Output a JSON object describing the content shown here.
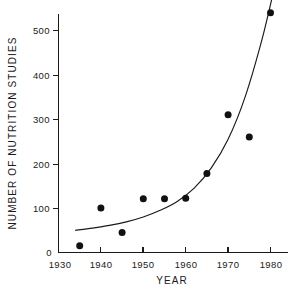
{
  "chart_data": {
    "type": "scatter",
    "title": "",
    "xlabel": "YEAR",
    "ylabel": "NUMBER OF NUTRITION STUDIES",
    "xlim": [
      1930,
      1984
    ],
    "ylim": [
      0,
      560
    ],
    "grid": false,
    "legend": "none",
    "x": [
      1935,
      1940,
      1945,
      1950,
      1955,
      1960,
      1965,
      1970,
      1975,
      1980
    ],
    "values": [
      15,
      100,
      45,
      121,
      121,
      122,
      178,
      310,
      260,
      540
    ],
    "points": [
      {
        "x": 1935,
        "y": 15
      },
      {
        "x": 1940,
        "y": 100
      },
      {
        "x": 1945,
        "y": 45
      },
      {
        "x": 1950,
        "y": 121
      },
      {
        "x": 1955,
        "y": 121
      },
      {
        "x": 1960,
        "y": 122
      },
      {
        "x": 1965,
        "y": 178
      },
      {
        "x": 1970,
        "y": 310
      },
      {
        "x": 1975,
        "y": 260
      },
      {
        "x": 1980,
        "y": 540
      }
    ],
    "fit_curve": {
      "name": "exponential trend",
      "x": [
        1934,
        1938,
        1942,
        1946,
        1950,
        1954,
        1958,
        1962,
        1966,
        1970,
        1974,
        1978,
        1981
      ],
      "y": [
        50,
        55,
        61,
        69,
        80,
        95,
        115,
        145,
        190,
        255,
        350,
        480,
        600
      ]
    },
    "xticks": [
      1930,
      1940,
      1950,
      1960,
      1970,
      1980
    ],
    "xtick_labels": [
      "1930",
      "1940",
      "1950",
      "1960",
      "1970",
      "1980"
    ],
    "yticks": [
      0,
      100,
      200,
      300,
      400,
      500
    ],
    "ytick_labels": [
      "0",
      "100",
      "200",
      "300",
      "400",
      "500"
    ],
    "marker": "filled-circle",
    "marker_color": "#111111",
    "line_color": "#1a1a1a",
    "background": "#ffffff"
  }
}
